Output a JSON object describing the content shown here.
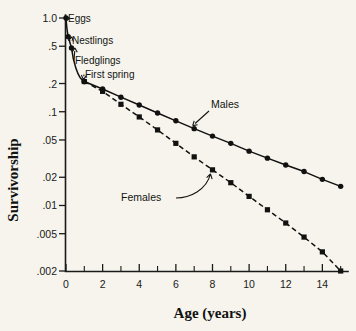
{
  "chart_data": {
    "type": "line",
    "title": "",
    "xlabel": "Age (years)",
    "ylabel": "Survivorship",
    "yscale": "log",
    "xlim": [
      0,
      15.4
    ],
    "ylim": [
      0.002,
      1.0
    ],
    "grid": false,
    "legend_position": "inline-annotations",
    "y_ticks": [
      {
        "value": 1.0,
        "label": "1.0"
      },
      {
        "value": 0.5,
        "label": ".5"
      },
      {
        "value": 0.2,
        "label": ".2"
      },
      {
        "value": 0.1,
        "label": ".1"
      },
      {
        "value": 0.05,
        "label": ".05"
      },
      {
        "value": 0.02,
        "label": ".02"
      },
      {
        "value": 0.01,
        "label": ".01"
      },
      {
        "value": 0.005,
        "label": ".005"
      },
      {
        "value": 0.002,
        "label": ".002"
      }
    ],
    "x_ticks_major": [
      {
        "value": 0,
        "label": "0"
      },
      {
        "value": 2,
        "label": "2"
      },
      {
        "value": 4,
        "label": "4"
      },
      {
        "value": 6,
        "label": "6"
      },
      {
        "value": 8,
        "label": "8"
      },
      {
        "value": 10,
        "label": "10"
      },
      {
        "value": 12,
        "label": "12"
      },
      {
        "value": 14,
        "label": "14"
      }
    ],
    "x_ticks_minor": [
      1,
      3,
      5,
      7,
      9,
      11,
      13,
      15
    ],
    "series": [
      {
        "name": "Early life (both sexes)",
        "style": "solid",
        "marker": "circle",
        "x": [
          0,
          0.12,
          0.3,
          1.0
        ],
        "y": [
          1.0,
          0.63,
          0.48,
          0.21
        ]
      },
      {
        "name": "Males",
        "style": "solid",
        "marker": "circle",
        "x": [
          1,
          2,
          3,
          4,
          5,
          6,
          7,
          8,
          9,
          10,
          11,
          12,
          13,
          14,
          15
        ],
        "y": [
          0.21,
          0.175,
          0.143,
          0.118,
          0.097,
          0.08,
          0.066,
          0.055,
          0.046,
          0.038,
          0.032,
          0.027,
          0.023,
          0.019,
          0.016
        ]
      },
      {
        "name": "Females",
        "style": "dashed",
        "marker": "square",
        "x": [
          1,
          2,
          3,
          4,
          5,
          6,
          7,
          8,
          9,
          10,
          11,
          12,
          13,
          14,
          15
        ],
        "y": [
          0.21,
          0.165,
          0.12,
          0.088,
          0.064,
          0.046,
          0.033,
          0.024,
          0.0175,
          0.0125,
          0.009,
          0.0065,
          0.0046,
          0.0032,
          0.002
        ]
      }
    ],
    "annotations": [
      {
        "text": "Eggs",
        "x": 0,
        "y": 1.0
      },
      {
        "text": "Nestlings",
        "x": 0.12,
        "y": 0.63
      },
      {
        "text": "Fledglings",
        "x": 0.3,
        "y": 0.48
      },
      {
        "text": "First spring",
        "x": 1.0,
        "y": 0.21
      },
      {
        "text": "Males",
        "x": 7.0,
        "y": 0.066
      },
      {
        "text": "Females",
        "x": 8.0,
        "y": 0.024
      }
    ]
  },
  "figure": {
    "y_axis_title": "Survivorship",
    "x_axis_title": "Age (years)",
    "label_eggs": "Eggs",
    "label_nestlings": "Nestlings",
    "label_fledglings": "Fledglings",
    "label_first_spring": "First spring",
    "label_males": "Males",
    "label_females": "Females",
    "colors": {
      "background": "#f6f4ed",
      "ink": "#111110"
    }
  }
}
